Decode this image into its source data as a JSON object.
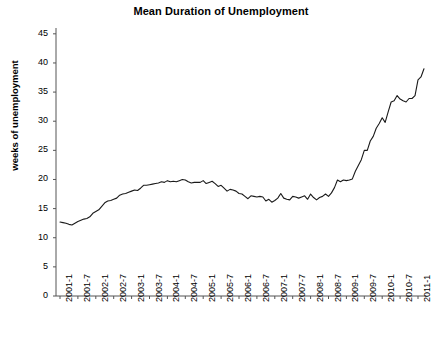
{
  "chart_data": {
    "type": "line",
    "title": "Mean Duration of Unemployment",
    "xlabel": "",
    "ylabel": "weeks of unemployment",
    "ylim": [
      0,
      46
    ],
    "yticks": [
      0,
      5,
      10,
      15,
      20,
      25,
      30,
      35,
      40,
      45
    ],
    "grid": false,
    "legend": null,
    "line_color": "#1a1a1a",
    "axis_color": "#555555",
    "xtick_labels": [
      "2001-1",
      "2001-7",
      "2002-1",
      "2002-7",
      "2003-1",
      "2003-7",
      "2004-1",
      "2004-7",
      "2005-1",
      "2005-7",
      "2006-1",
      "2006-7",
      "2007-1",
      "2007-7",
      "2008-1",
      "2008-7",
      "2009-1",
      "2009-7",
      "2010-1",
      "2010-7",
      "2011-1"
    ],
    "x": [
      "2001-1",
      "2001-2",
      "2001-3",
      "2001-4",
      "2001-5",
      "2001-6",
      "2001-7",
      "2001-8",
      "2001-9",
      "2001-10",
      "2001-11",
      "2001-12",
      "2002-1",
      "2002-2",
      "2002-3",
      "2002-4",
      "2002-5",
      "2002-6",
      "2002-7",
      "2002-8",
      "2002-9",
      "2002-10",
      "2002-11",
      "2002-12",
      "2003-1",
      "2003-2",
      "2003-3",
      "2003-4",
      "2003-5",
      "2003-6",
      "2003-7",
      "2003-8",
      "2003-9",
      "2003-10",
      "2003-11",
      "2003-12",
      "2004-1",
      "2004-2",
      "2004-3",
      "2004-4",
      "2004-5",
      "2004-6",
      "2004-7",
      "2004-8",
      "2004-9",
      "2004-10",
      "2004-11",
      "2004-12",
      "2005-1",
      "2005-2",
      "2005-3",
      "2005-4",
      "2005-5",
      "2005-6",
      "2005-7",
      "2005-8",
      "2005-9",
      "2005-10",
      "2005-11",
      "2005-12",
      "2006-1",
      "2006-2",
      "2006-3",
      "2006-4",
      "2006-5",
      "2006-6",
      "2006-7",
      "2006-8",
      "2006-9",
      "2006-10",
      "2006-11",
      "2006-12",
      "2007-1",
      "2007-2",
      "2007-3",
      "2007-4",
      "2007-5",
      "2007-6",
      "2007-7",
      "2007-8",
      "2007-9",
      "2007-10",
      "2007-11",
      "2007-12",
      "2008-1",
      "2008-2",
      "2008-3",
      "2008-4",
      "2008-5",
      "2008-6",
      "2008-7",
      "2008-8",
      "2008-9",
      "2008-10",
      "2008-11",
      "2008-12",
      "2009-1",
      "2009-2",
      "2009-3",
      "2009-4",
      "2009-5",
      "2009-6",
      "2009-7",
      "2009-8",
      "2009-9",
      "2009-10",
      "2009-11",
      "2009-12",
      "2010-1",
      "2010-2",
      "2010-3",
      "2010-4",
      "2010-5",
      "2010-6",
      "2010-7",
      "2010-8",
      "2010-9",
      "2010-10",
      "2010-11",
      "2010-12",
      "2011-1",
      "2011-2",
      "2011-3"
    ],
    "values": [
      12.7,
      12.6,
      12.5,
      12.3,
      12.2,
      12.5,
      12.8,
      13.0,
      13.2,
      13.3,
      13.6,
      14.2,
      14.5,
      14.8,
      15.4,
      16.0,
      16.3,
      16.4,
      16.6,
      16.8,
      17.3,
      17.5,
      17.6,
      17.8,
      18.0,
      18.2,
      18.1,
      18.5,
      19.0,
      19.0,
      19.1,
      19.2,
      19.3,
      19.4,
      19.6,
      19.5,
      19.8,
      19.6,
      19.7,
      19.6,
      19.8,
      20.0,
      19.9,
      19.6,
      19.4,
      19.5,
      19.5,
      19.5,
      19.8,
      19.3,
      19.5,
      19.7,
      19.3,
      18.8,
      19.0,
      18.5,
      18.0,
      18.3,
      18.2,
      18.0,
      17.6,
      17.5,
      17.1,
      16.7,
      17.2,
      17.1,
      17.0,
      17.1,
      17.0,
      16.3,
      16.6,
      16.1,
      16.4,
      16.8,
      17.6,
      16.8,
      16.6,
      16.5,
      17.1,
      17.0,
      16.8,
      17.0,
      17.2,
      16.6,
      17.5,
      16.9,
      16.5,
      16.9,
      17.1,
      17.5,
      17.1,
      17.7,
      18.6,
      19.9,
      19.6,
      19.9,
      19.8,
      19.9,
      20.1,
      21.4,
      22.4,
      23.4,
      25.0,
      25.0,
      26.6,
      27.4,
      28.8,
      29.6,
      30.6,
      29.8,
      31.6,
      33.3,
      33.5,
      34.4,
      33.8,
      33.5,
      33.3,
      33.9,
      33.9,
      34.4,
      37.1,
      37.6,
      39.0
    ]
  }
}
